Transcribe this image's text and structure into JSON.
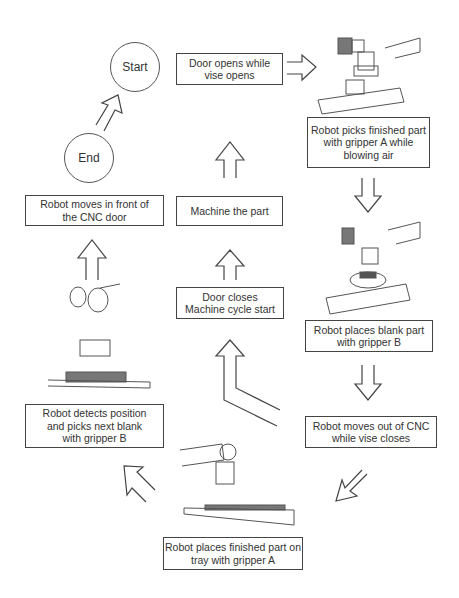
{
  "nodes": {
    "start": "Start",
    "end": "End",
    "door_opens": "Door opens while\nvise opens",
    "picks_finished": "Robot picks finished part\nwith gripper A while\nblowing air",
    "places_blank": "Robot places blank part\nwith gripper B",
    "moves_out": "Robot moves out of CNC\nwhile vise closes",
    "places_tray": "Robot places finished part on\ntray with gripper A",
    "detects": "Robot detects position\nand picks next blank\nwith gripper B",
    "moves_front": "Robot moves in front of\nthe CNC door",
    "machine": "Machine the part",
    "door_closes": "Door closes\nMachine cycle start"
  },
  "colors": {
    "stroke": "#444444",
    "text": "#333333",
    "fill": "#ffffff"
  }
}
